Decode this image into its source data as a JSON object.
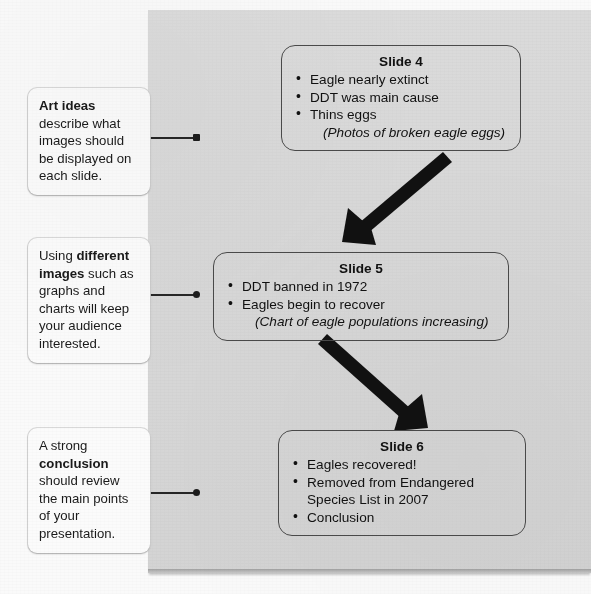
{
  "panel": {
    "background_color": "#d7d7d7"
  },
  "callouts": [
    {
      "id": "art-ideas",
      "lead": "Art ideas",
      "body": " describe what images should be displayed on each slide."
    },
    {
      "id": "images",
      "pre": "Using ",
      "lead": "different images",
      "body": " such as graphs and charts will keep your audience interested."
    },
    {
      "id": "conclusion",
      "pre": "A strong ",
      "lead": "conclusion",
      "body": " should review the main points of your presentation."
    }
  ],
  "slides": [
    {
      "id": "slide-4",
      "title": "Slide 4",
      "bullets": [
        "Eagle nearly extinct",
        "DDT was main cause",
        "Thins eggs"
      ],
      "note": "(Photos of broken eagle eggs)"
    },
    {
      "id": "slide-5",
      "title": "Slide 5",
      "bullets": [
        "DDT banned in 1972",
        "Eagles begin to recover"
      ],
      "note": "(Chart of eagle populations increasing)"
    },
    {
      "id": "slide-6",
      "title": "Slide 6",
      "bullets": [
        "Eagles recovered!",
        "Removed from Endangered Species List in 2007",
        "Conclusion"
      ],
      "note": ""
    }
  ],
  "arrows": [
    {
      "id": "arrow-slide4-to-slide5",
      "direction": "down-left",
      "color": "#111111"
    },
    {
      "id": "arrow-slide5-to-slide6",
      "direction": "down-right",
      "color": "#111111"
    }
  ]
}
